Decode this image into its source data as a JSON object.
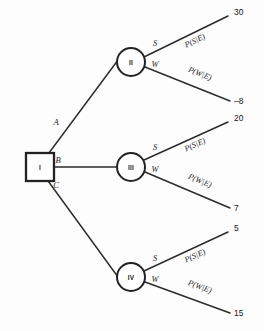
{
  "diagram": {
    "type": "decision-tree",
    "root": {
      "id": "I",
      "shape": "square",
      "label": "I"
    },
    "decision_branches": [
      {
        "label": "A",
        "leads_to": "II"
      },
      {
        "label": "B",
        "leads_to": "III"
      },
      {
        "label": "C",
        "leads_to": "IV"
      }
    ],
    "chance_nodes": [
      {
        "id": "II",
        "shape": "circle",
        "label": "II",
        "outcomes": [
          {
            "state": "S",
            "probability": "P(S|E)",
            "payoff": "30"
          },
          {
            "state": "W",
            "probability": "P(W|E)",
            "payoff": "–8"
          }
        ]
      },
      {
        "id": "III",
        "shape": "circle",
        "label": "III",
        "outcomes": [
          {
            "state": "S",
            "probability": "P(S|E)",
            "payoff": "20"
          },
          {
            "state": "W",
            "probability": "P(W|E)",
            "payoff": "7"
          }
        ]
      },
      {
        "id": "IV",
        "shape": "circle",
        "label": "IV",
        "outcomes": [
          {
            "state": "S",
            "probability": "P(S|E)",
            "payoff": "5"
          },
          {
            "state": "W",
            "probability": "P(W|E)",
            "payoff": "15"
          }
        ]
      }
    ],
    "colors": {
      "line": "#2b2b2b",
      "text": "#1c1c1c",
      "background": "#fdfdfd",
      "node_fill": "#ffffff"
    }
  }
}
